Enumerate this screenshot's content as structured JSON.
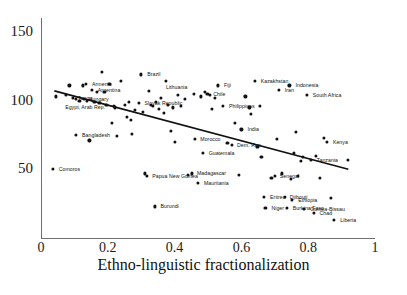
{
  "chart_data": {
    "type": "scatter",
    "title": "",
    "xlabel": "Ethno-linguistic fractionalization",
    "ylabel": "",
    "xlim": [
      0,
      1
    ],
    "ylim": [
      0,
      160
    ],
    "xticks": [
      "0",
      "0.2",
      "0.4",
      "0.6",
      "0.8",
      "1"
    ],
    "xtick_values": [
      0,
      0.2,
      0.4,
      0.6,
      0.8,
      1
    ],
    "yticks": [
      "150",
      "100",
      "50"
    ],
    "ytick_values": [
      150,
      100,
      50
    ],
    "grid": false,
    "legend": null,
    "trendline": {
      "description": "downward-sloping fitted regression line",
      "x0": 0.04,
      "y0": 107,
      "x1": 0.92,
      "y1": 50
    },
    "points": [
      {
        "x": 0.035,
        "y": 50,
        "label": "Comoros",
        "lx": 6,
        "ly": 0
      },
      {
        "x": 0.045,
        "y": 103,
        "label": "",
        "lx": 0,
        "ly": 0
      },
      {
        "x": 0.075,
        "y": 104,
        "label": "",
        "lx": 0,
        "ly": 0
      },
      {
        "x": 0.085,
        "y": 111,
        "label": "",
        "lx": 0,
        "ly": 0
      },
      {
        "x": 0.095,
        "y": 102,
        "label": "Tonga",
        "lx": 5,
        "ly": 0
      },
      {
        "x": 0.105,
        "y": 101,
        "label": "",
        "lx": 0,
        "ly": 0
      },
      {
        "x": 0.105,
        "y": 75,
        "label": "Bangladesh",
        "lx": 6,
        "ly": 0
      },
      {
        "x": 0.115,
        "y": 100,
        "label": "",
        "lx": 0,
        "ly": 0
      },
      {
        "x": 0.125,
        "y": 111,
        "label": "",
        "lx": 0,
        "ly": 0
      },
      {
        "x": 0.128,
        "y": 101,
        "label": "Hungary",
        "lx": 5,
        "ly": 0
      },
      {
        "x": 0.135,
        "y": 112,
        "label": "Armenia",
        "lx": 6,
        "ly": 0
      },
      {
        "x": 0.138,
        "y": 100,
        "label": "",
        "lx": 0,
        "ly": 0
      },
      {
        "x": 0.145,
        "y": 71,
        "label": "",
        "lx": 0,
        "ly": 0
      },
      {
        "x": 0.152,
        "y": 108,
        "label": "Argentina",
        "lx": 6,
        "ly": 0
      },
      {
        "x": 0.16,
        "y": 99,
        "label": "",
        "lx": 0,
        "ly": 0
      },
      {
        "x": 0.168,
        "y": 106,
        "label": "",
        "lx": 0,
        "ly": 0
      },
      {
        "x": 0.175,
        "y": 98,
        "label": "",
        "lx": 0,
        "ly": 0
      },
      {
        "x": 0.182,
        "y": 121,
        "label": "",
        "lx": 0,
        "ly": 0
      },
      {
        "x": 0.19,
        "y": 106,
        "label": "",
        "lx": 0,
        "ly": 0
      },
      {
        "x": 0.196,
        "y": 97,
        "label": "",
        "lx": 0,
        "ly": 0
      },
      {
        "x": 0.205,
        "y": 112,
        "label": "",
        "lx": 0,
        "ly": 0
      },
      {
        "x": 0.212,
        "y": 84,
        "label": "",
        "lx": 0,
        "ly": 0
      },
      {
        "x": 0.218,
        "y": 96,
        "label": "",
        "lx": 0,
        "ly": 0
      },
      {
        "x": 0.222,
        "y": 95,
        "label": "Egypt, Arab Rep.",
        "lx": -50,
        "ly": 0
      },
      {
        "x": 0.228,
        "y": 74,
        "label": "",
        "lx": 0,
        "ly": 0
      },
      {
        "x": 0.24,
        "y": 114,
        "label": "",
        "lx": 0,
        "ly": 0
      },
      {
        "x": 0.25,
        "y": 97,
        "label": "",
        "lx": 0,
        "ly": 0
      },
      {
        "x": 0.258,
        "y": 88,
        "label": "",
        "lx": 0,
        "ly": 0
      },
      {
        "x": 0.262,
        "y": 99,
        "label": "",
        "lx": 0,
        "ly": 0
      },
      {
        "x": 0.268,
        "y": 86,
        "label": "",
        "lx": 0,
        "ly": 0
      },
      {
        "x": 0.272,
        "y": 76,
        "label": "",
        "lx": 0,
        "ly": 0
      },
      {
        "x": 0.28,
        "y": 93,
        "label": "",
        "lx": 0,
        "ly": 0
      },
      {
        "x": 0.292,
        "y": 98,
        "label": "Slovak Republic",
        "lx": 6,
        "ly": 0
      },
      {
        "x": 0.3,
        "y": 119,
        "label": "Brazil",
        "lx": 6,
        "ly": 0
      },
      {
        "x": 0.305,
        "y": 92,
        "label": "",
        "lx": 0,
        "ly": 0
      },
      {
        "x": 0.312,
        "y": 47,
        "label": "",
        "lx": 0,
        "ly": 0
      },
      {
        "x": 0.318,
        "y": 45,
        "label": "Papua New Guinea",
        "lx": 5,
        "ly": 0
      },
      {
        "x": 0.322,
        "y": 107,
        "label": "",
        "lx": 0,
        "ly": 0
      },
      {
        "x": 0.328,
        "y": 97,
        "label": "",
        "lx": 0,
        "ly": 0
      },
      {
        "x": 0.334,
        "y": 96,
        "label": "",
        "lx": 0,
        "ly": 0
      },
      {
        "x": 0.34,
        "y": 23,
        "label": "Burundi",
        "lx": 6,
        "ly": 0
      },
      {
        "x": 0.345,
        "y": 99,
        "label": "",
        "lx": 0,
        "ly": 0
      },
      {
        "x": 0.352,
        "y": 94,
        "label": "",
        "lx": 0,
        "ly": 0
      },
      {
        "x": 0.36,
        "y": 102,
        "label": "",
        "lx": 0,
        "ly": 0
      },
      {
        "x": 0.368,
        "y": 91,
        "label": "",
        "lx": 0,
        "ly": 0
      },
      {
        "x": 0.375,
        "y": 114,
        "label": "",
        "lx": 0,
        "ly": 0
      },
      {
        "x": 0.38,
        "y": 97,
        "label": "",
        "lx": 0,
        "ly": 0
      },
      {
        "x": 0.388,
        "y": 78,
        "label": "",
        "lx": 0,
        "ly": 0
      },
      {
        "x": 0.395,
        "y": 95,
        "label": "",
        "lx": 0,
        "ly": 0
      },
      {
        "x": 0.402,
        "y": 70,
        "label": "",
        "lx": 0,
        "ly": 0
      },
      {
        "x": 0.41,
        "y": 104,
        "label": "",
        "lx": 0,
        "ly": 0
      },
      {
        "x": 0.42,
        "y": 96,
        "label": "",
        "lx": 0,
        "ly": 0
      },
      {
        "x": 0.432,
        "y": 101,
        "label": "",
        "lx": 0,
        "ly": 0
      },
      {
        "x": 0.44,
        "y": 46,
        "label": "",
        "lx": 0,
        "ly": 0
      },
      {
        "x": 0.452,
        "y": 47,
        "label": "Madagascar",
        "lx": 5,
        "ly": 0
      },
      {
        "x": 0.458,
        "y": 105,
        "label": "Lithuania",
        "lx": -28,
        "ly": -7
      },
      {
        "x": 0.462,
        "y": 72,
        "label": "Morocco",
        "lx": 5,
        "ly": 0
      },
      {
        "x": 0.47,
        "y": 40,
        "label": "Mauritania",
        "lx": 6,
        "ly": 0
      },
      {
        "x": 0.478,
        "y": 103,
        "label": "",
        "lx": 0,
        "ly": 0
      },
      {
        "x": 0.484,
        "y": 62,
        "label": "Guatemala",
        "lx": 6,
        "ly": 0
      },
      {
        "x": 0.49,
        "y": 106,
        "label": "",
        "lx": 0,
        "ly": 0
      },
      {
        "x": 0.498,
        "y": 105,
        "label": "Chile",
        "lx": 6,
        "ly": 0
      },
      {
        "x": 0.505,
        "y": 104,
        "label": "",
        "lx": 0,
        "ly": 0
      },
      {
        "x": 0.512,
        "y": 94,
        "label": "",
        "lx": 0,
        "ly": 0
      },
      {
        "x": 0.52,
        "y": 102,
        "label": "",
        "lx": 0,
        "ly": 0
      },
      {
        "x": 0.53,
        "y": 111,
        "label": "Fiji",
        "lx": 6,
        "ly": 0
      },
      {
        "x": 0.545,
        "y": 96,
        "label": "Philippines",
        "lx": 6,
        "ly": 0
      },
      {
        "x": 0.558,
        "y": 69,
        "label": "",
        "lx": 0,
        "ly": 0
      },
      {
        "x": 0.572,
        "y": 68,
        "label": "Dem. Rep.",
        "lx": 5,
        "ly": 0
      },
      {
        "x": 0.58,
        "y": 84,
        "label": "",
        "lx": 0,
        "ly": 0
      },
      {
        "x": 0.592,
        "y": 46,
        "label": "",
        "lx": 0,
        "ly": 0
      },
      {
        "x": 0.6,
        "y": 79,
        "label": "India",
        "lx": 6,
        "ly": 0
      },
      {
        "x": 0.612,
        "y": 103,
        "label": "",
        "lx": 0,
        "ly": 0
      },
      {
        "x": 0.624,
        "y": 95,
        "label": "",
        "lx": 0,
        "ly": 0
      },
      {
        "x": 0.628,
        "y": 90,
        "label": "",
        "lx": 0,
        "ly": 0
      },
      {
        "x": 0.64,
        "y": 114,
        "label": "Kazakhstan",
        "lx": 6,
        "ly": 0
      },
      {
        "x": 0.648,
        "y": 66,
        "label": "",
        "lx": 0,
        "ly": 0
      },
      {
        "x": 0.655,
        "y": 96,
        "label": "",
        "lx": 0,
        "ly": 0
      },
      {
        "x": 0.66,
        "y": 59,
        "label": "",
        "lx": 0,
        "ly": 0
      },
      {
        "x": 0.668,
        "y": 30,
        "label": "Eritrea",
        "lx": 6,
        "ly": 0
      },
      {
        "x": 0.672,
        "y": 22,
        "label": "Niger",
        "lx": 6,
        "ly": 0
      },
      {
        "x": 0.69,
        "y": 44,
        "label": "",
        "lx": 0,
        "ly": 0
      },
      {
        "x": 0.7,
        "y": 45,
        "label": "Senegal",
        "lx": 5,
        "ly": 0
      },
      {
        "x": 0.706,
        "y": 72,
        "label": "",
        "lx": 0,
        "ly": 0
      },
      {
        "x": 0.712,
        "y": 108,
        "label": "Iran",
        "lx": 6,
        "ly": 0
      },
      {
        "x": 0.722,
        "y": 47,
        "label": "",
        "lx": 0,
        "ly": 0
      },
      {
        "x": 0.73,
        "y": 30,
        "label": "Djibouti",
        "lx": 5,
        "ly": 0
      },
      {
        "x": 0.736,
        "y": 22,
        "label": "Burkina Faso",
        "lx": 6,
        "ly": 0
      },
      {
        "x": 0.744,
        "y": 111,
        "label": "Indonesia",
        "lx": 6,
        "ly": 0
      },
      {
        "x": 0.748,
        "y": 43,
        "label": "",
        "lx": 0,
        "ly": 0
      },
      {
        "x": 0.752,
        "y": 28,
        "label": "Ethiopia",
        "lx": 6,
        "ly": 0
      },
      {
        "x": 0.758,
        "y": 62,
        "label": "",
        "lx": 0,
        "ly": 0
      },
      {
        "x": 0.762,
        "y": 77,
        "label": "",
        "lx": 0,
        "ly": 0
      },
      {
        "x": 0.77,
        "y": 45,
        "label": "",
        "lx": 0,
        "ly": 0
      },
      {
        "x": 0.778,
        "y": 56,
        "label": "",
        "lx": 0,
        "ly": 0
      },
      {
        "x": 0.784,
        "y": 59,
        "label": "",
        "lx": 0,
        "ly": 0
      },
      {
        "x": 0.788,
        "y": 21,
        "label": "Guinea-Bissau",
        "lx": 6,
        "ly": 0
      },
      {
        "x": 0.796,
        "y": 104,
        "label": "South Africa",
        "lx": 6,
        "ly": 0
      },
      {
        "x": 0.808,
        "y": 57,
        "label": "Tanzania",
        "lx": 6,
        "ly": 0
      },
      {
        "x": 0.816,
        "y": 18,
        "label": "Chad",
        "lx": 6,
        "ly": 0
      },
      {
        "x": 0.824,
        "y": 60,
        "label": "",
        "lx": 0,
        "ly": 0
      },
      {
        "x": 0.836,
        "y": 44,
        "label": "",
        "lx": 0,
        "ly": 0
      },
      {
        "x": 0.848,
        "y": 73,
        "label": "",
        "lx": 0,
        "ly": 0
      },
      {
        "x": 0.856,
        "y": 70,
        "label": "Kenya",
        "lx": 6,
        "ly": 0
      },
      {
        "x": 0.868,
        "y": 29,
        "label": "",
        "lx": 0,
        "ly": 0
      },
      {
        "x": 0.878,
        "y": 13,
        "label": "Liberia",
        "lx": 6,
        "ly": 0
      },
      {
        "x": 0.92,
        "y": 57,
        "label": "",
        "lx": 0,
        "ly": 0
      }
    ]
  }
}
